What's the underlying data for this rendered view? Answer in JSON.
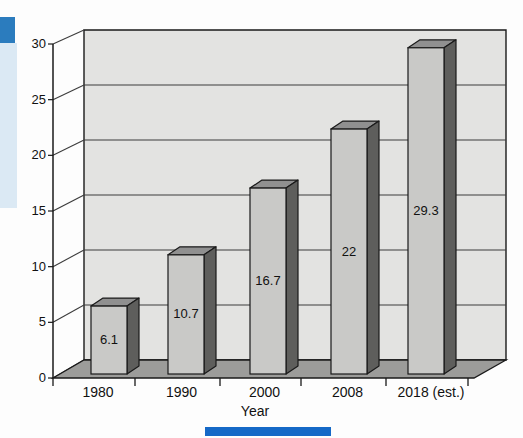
{
  "page": {
    "background": "#fdfdfd"
  },
  "decorations": {
    "sidebar_strip_color": "#dbe9f4",
    "accent_square_color": "#2b7cbe",
    "bottom_bar_color": "#1569c7"
  },
  "chart_data": {
    "type": "bar",
    "style": "3d-column",
    "title": "",
    "categories": [
      "1980",
      "1990",
      "2000",
      "2008",
      "2018 (est.)"
    ],
    "values": [
      6.1,
      10.7,
      16.7,
      22,
      29.3
    ],
    "value_labels": [
      "6.1",
      "10.7",
      "16.7",
      "22",
      "29.3"
    ],
    "xlabel": "Year",
    "ylabel": "",
    "ylim": [
      0,
      30
    ],
    "ytick_step": 5,
    "yticks": [
      0,
      5,
      10,
      15,
      20,
      25,
      30
    ],
    "grid": true,
    "legend": "none",
    "colors": {
      "wall": "#e3e3e1",
      "floor": "#9c9c9a",
      "bar_front": "#c9c9c7",
      "bar_top": "#909090",
      "bar_side": "#5e5e5c",
      "outline": "#1a1a1a",
      "gridline": "#3c3c3c",
      "text": "#111111"
    }
  }
}
